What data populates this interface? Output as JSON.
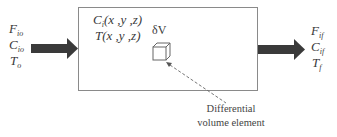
{
  "diagram": {
    "inlet": {
      "flow": {
        "base": "F",
        "sub": "io"
      },
      "concentration": {
        "base": "C",
        "sub": "io"
      },
      "temperature": {
        "base": "T",
        "sub": "o"
      }
    },
    "outlet": {
      "flow": {
        "base": "F",
        "sub": "if"
      },
      "concentration": {
        "base": "C",
        "sub": "if"
      },
      "temperature": {
        "base": "T",
        "sub": "f"
      }
    },
    "reactor": {
      "concentration_field": {
        "base": "C",
        "sub": "i",
        "args": "(x ,y ,z)"
      },
      "temperature_field": {
        "base": "T",
        "args": "(x ,y ,z)"
      },
      "element_label": "δV"
    },
    "annotation": {
      "line1": "Differential",
      "line2": "volume element"
    },
    "colors": {
      "arrow": "#3a3a3a",
      "box_border": "#8a8a8a",
      "text": "#3a3a3a"
    }
  }
}
